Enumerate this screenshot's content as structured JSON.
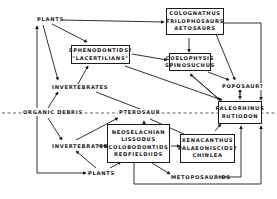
{
  "diagram": {
    "type": "food-web",
    "nodes": {
      "plants_top": "PLANTS",
      "coelognathus_box": [
        "COLOGNATHUS",
        "TRILOPHOSAURS",
        "AETOSAURS"
      ],
      "sphenodontids_box": [
        "SPHENODONTIDS?",
        "\"LACERTILIANS\""
      ],
      "coelophysis_box": [
        "COELOPHYSIS",
        "SPINOSUCHUS"
      ],
      "invertebrates_top": "INVERTEBRATES",
      "poposaur": "POPOSAUR?",
      "organic_debris": "ORGANIC DEBRIS",
      "pterosaur": "PTEROSAUR",
      "paleorhinus_box": [
        "PALEORHINUS",
        "RUTIODON"
      ],
      "neoselachian_box": [
        "NEOSELACHIAN",
        "LISSODUS",
        "COLOBODONTIDS",
        "REDFIELDIIDS"
      ],
      "invertebrates_bottom": "INVERTEBRATES",
      "xenacanthus_box": [
        "XENACANTHUS",
        "PALAEONISCIDS?",
        "CHINLEA"
      ],
      "metoposaurids": "METOPOSAURIDS",
      "plants_bottom": "PLANTS"
    },
    "divider": "dashed horizontal line separating terrestrial (top) and aquatic (bottom) realms"
  }
}
